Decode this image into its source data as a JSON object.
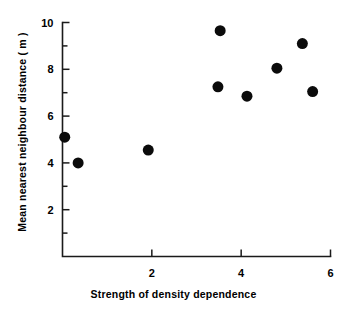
{
  "chart_data": {
    "type": "scatter",
    "title": "",
    "xlabel": "Strength of density dependence",
    "ylabel": "Mean nearest neighbour distance ( m )",
    "xlim": [
      0,
      6
    ],
    "ylim": [
      0,
      10
    ],
    "xticks": [
      2,
      4,
      6
    ],
    "yticks": [
      2,
      4,
      6,
      8,
      10
    ],
    "xtick_labels": [
      "2",
      "4",
      "6"
    ],
    "ytick_labels": [
      "2",
      "4",
      "6",
      "8",
      "10"
    ],
    "x_minor_ticks": [
      1,
      3,
      5
    ],
    "y_minor_ticks": [
      1,
      3,
      5,
      7,
      9
    ],
    "grid": false,
    "legend": false,
    "marker": "filled-circle",
    "marker_color": "#0b0b0b",
    "marker_size_px": 11,
    "points": [
      {
        "x": 0.05,
        "y": 5.1
      },
      {
        "x": 0.35,
        "y": 4.0
      },
      {
        "x": 1.92,
        "y": 4.55
      },
      {
        "x": 3.48,
        "y": 7.25
      },
      {
        "x": 3.53,
        "y": 9.65
      },
      {
        "x": 4.13,
        "y": 6.85
      },
      {
        "x": 4.8,
        "y": 8.05
      },
      {
        "x": 5.37,
        "y": 9.1
      },
      {
        "x": 5.6,
        "y": 7.05
      }
    ]
  }
}
